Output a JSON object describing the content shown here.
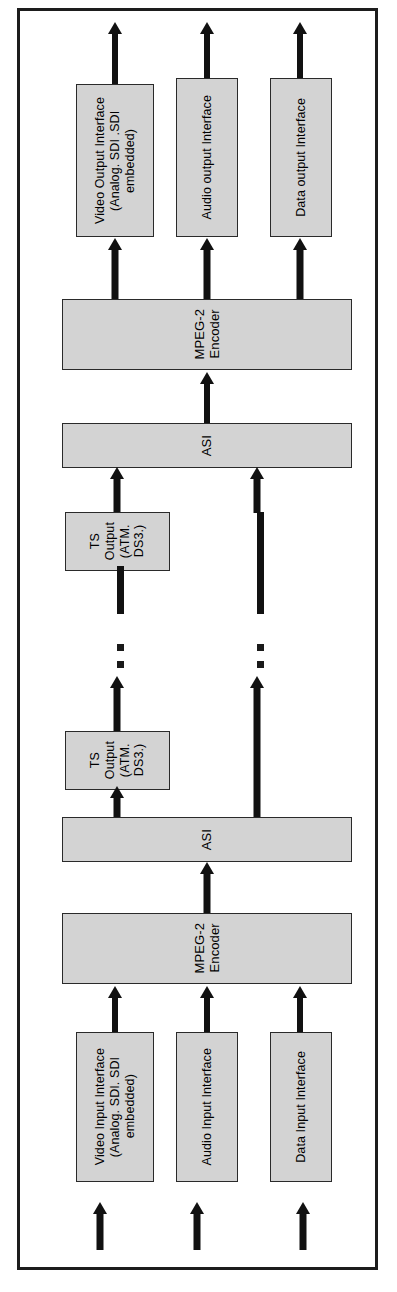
{
  "diagram": {
    "type": "block-diagram",
    "frame_color": "#1d1d1d",
    "block_fill": "#d3d3d3",
    "arrow_color": "#111111",
    "blocks": {
      "video_output_interface": "Video Output Interface\n(Analog. SDI .SDI\nembedded)",
      "audio_output_interface": "Audio output Interface",
      "data_output_interface": "Data output Interface",
      "mpeg2_decoder_bar": "MPEG-2\nEncoder",
      "asi_bar_upper": "ASI",
      "ts_output_upper": "TS\nOutput\n(ATM.\nDS3.)",
      "ts_output_lower": "TS\nOutput\n(ATM.\nDS3.)",
      "asi_bar_lower": "ASI",
      "mpeg2_encoder_bar": "MPEG-2\nEncoder",
      "video_input_interface": "Video Input Interface\n(Analog. SDI. SDI\nembedded)",
      "audio_input_interface": "Audio Input Interface",
      "data_input_interface": "Data Input Interface"
    },
    "connectors": {
      "video_out_up": "arrow-up",
      "audio_out_up": "arrow-up",
      "data_out_up": "arrow-up",
      "decoder_to_video_out": "arrow-up",
      "decoder_to_audio_out": "arrow-up",
      "decoder_to_data_out": "arrow-up",
      "asi_upper_to_decoder": "arrow-up",
      "ts_upper_to_asi_upper": "arrow-up",
      "link_video_dashed": "dashed-break",
      "link_data_dashed": "dashed-break",
      "ts_lower_to_link": "arrow-up",
      "data_lower_to_link": "arrow-up",
      "asi_lower_to_ts_lower": "arrow-up",
      "asi_lower_to_data_link": "line",
      "encoder_to_asi_lower": "arrow-up",
      "video_in_to_encoder": "arrow-up",
      "audio_in_to_encoder": "arrow-up",
      "data_in_to_encoder": "arrow-up",
      "video_in_source": "arrow-up",
      "audio_in_source": "arrow-up",
      "data_in_source": "arrow-up"
    }
  }
}
